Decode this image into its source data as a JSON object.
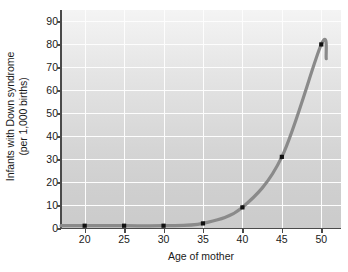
{
  "chart_data": {
    "type": "line",
    "title": "",
    "subtitle": "",
    "xlabel": "Age of mother",
    "ylabel": "Infants with Down syndrome (per 1,000 births)",
    "ylabel_line1": "Infants with Down syndrome",
    "ylabel_line2": "(per 1,000 births)",
    "x": [
      20,
      25,
      30,
      35,
      40,
      45,
      50
    ],
    "values": [
      1,
      1,
      1,
      2,
      9,
      31,
      80
    ],
    "series": [
      {
        "name": "Infants with Down syndrome per 1,000 births",
        "x": [
          20,
          25,
          30,
          35,
          40,
          45,
          50
        ],
        "values": [
          1,
          1,
          1,
          2,
          9,
          31,
          80
        ]
      }
    ],
    "xlim": [
      17,
      52.5
    ],
    "ylim": [
      0,
      95
    ],
    "xticks": [
      20,
      25,
      30,
      35,
      40,
      45,
      50
    ],
    "xtick_labels": [
      "20",
      "25",
      "30",
      "35",
      "40",
      "45",
      "50"
    ],
    "yticks": [
      0,
      10,
      20,
      30,
      40,
      50,
      60,
      70,
      80,
      90
    ],
    "ytick_labels": [
      "0",
      "10",
      "20",
      "30",
      "40",
      "50",
      "60",
      "70",
      "80",
      "90"
    ],
    "grid": true,
    "grid_color": "#fdfdfd",
    "legend": false,
    "legend_position": "none",
    "line_color": "#8a8a8a",
    "marker_color": "#111111",
    "marker_shape": "square",
    "plot_background": "#dcdcdc",
    "axis_color": "#4a4a4a",
    "annotations": []
  }
}
